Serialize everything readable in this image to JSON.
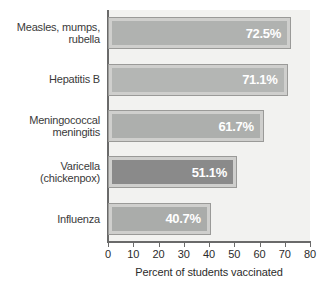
{
  "chart_data": {
    "type": "bar",
    "orientation": "horizontal",
    "title": "",
    "xlabel": "Percent of students vaccinated",
    "ylabel": "",
    "xlim": [
      0,
      80
    ],
    "xticks": [
      0,
      10,
      20,
      30,
      40,
      50,
      60,
      70,
      80
    ],
    "grid": false,
    "legend": null,
    "categories": [
      "Measles, mumps, rubella",
      "Hepatitis B",
      "Meningococcal meningitis",
      "Varicella (chickenpox)",
      "Influenza"
    ],
    "values": [
      72.5,
      71.1,
      61.7,
      51.1,
      40.7
    ],
    "data_labels": [
      "72.5%",
      "71.1%",
      "61.7%",
      "51.1%",
      "40.7%"
    ],
    "bar_fill_colors": [
      "#b0b2b0",
      "#b4b6b4",
      "#adafad",
      "#8a8a8a",
      "#aaacaa"
    ],
    "bar_frame_color": "#cfcfcd",
    "bar_border_color": "#9a9a98",
    "plot_background": "#f2f2f0",
    "axis_color": "#6a6a6a",
    "label_text_color": "#ffffff"
  },
  "categories_display": [
    {
      "line1": "Measles, mumps,",
      "line2": "rubella"
    },
    {
      "line1": "Hepatitis B",
      "line2": ""
    },
    {
      "line1": "Meningococcal",
      "line2": "meningitis"
    },
    {
      "line1": "Varicella",
      "line2": "(chickenpox)"
    },
    {
      "line1": "Influenza",
      "line2": ""
    }
  ],
  "axis": {
    "title": "Percent of students vaccinated",
    "ticks": [
      "0",
      "10",
      "20",
      "30",
      "40",
      "50",
      "60",
      "70",
      "80"
    ]
  }
}
